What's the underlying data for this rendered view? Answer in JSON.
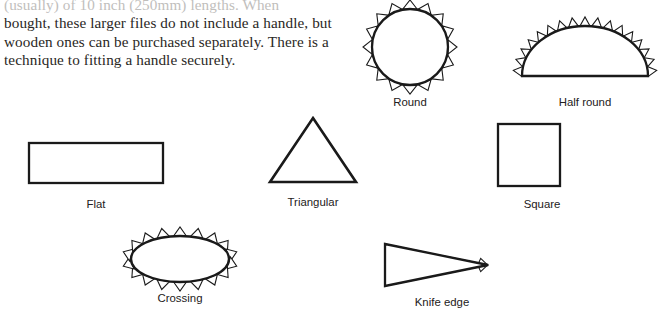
{
  "page": {
    "background_color": "#ffffff",
    "ink_color": "#1a1a1a",
    "text_color": "#2a2724"
  },
  "paragraph": {
    "clipped_top_line": "(usually) of 10 inch (250mm) lengths. When",
    "lines": [
      "bought, these larger files do not include a handle, but",
      "wooden ones can be purchased separately. There is a",
      "technique to fitting a handle securely."
    ]
  },
  "figures": [
    {
      "id": "round",
      "caption": "Round",
      "shape": "circle",
      "teeth": 16,
      "description": "circle with outward serrated teeth all around"
    },
    {
      "id": "half-round",
      "caption": "Half round",
      "shape": "semicircle",
      "teeth_arc": 17,
      "teeth_base": 14,
      "description": "dome with serrated teeth on arc and flat base"
    },
    {
      "id": "flat",
      "caption": "Flat",
      "shape": "rectangle",
      "teeth_top": 14,
      "teeth_bottom": 14,
      "teeth_side": 4,
      "description": "rectangle with serrated teeth on all four sides"
    },
    {
      "id": "triangular",
      "caption": "Triangular",
      "shape": "triangle",
      "teeth_per_side": 8,
      "description": "equilateral triangle with serrated teeth on all sides"
    },
    {
      "id": "square",
      "caption": "Square",
      "shape": "square",
      "teeth_per_side": 7,
      "description": "square with serrated teeth on all four sides"
    },
    {
      "id": "crossing",
      "caption": "Crossing",
      "shape": "ellipse",
      "teeth": 18,
      "description": "ellipse with serrated teeth all around"
    },
    {
      "id": "knife-edge",
      "caption": "Knife edge",
      "shape": "wedge",
      "teeth_top": 9,
      "teeth_bottom": 9,
      "teeth_left": 4,
      "description": "narrow wedge pointing right with serrated teeth"
    }
  ]
}
